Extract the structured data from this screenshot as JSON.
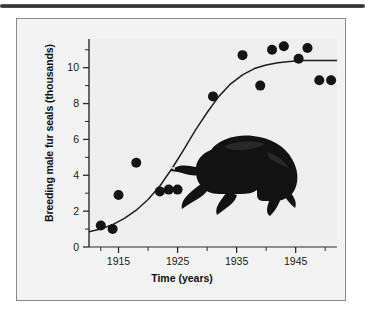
{
  "figure": {
    "background_color": "#f3f3f3",
    "frame_color": "#8a8a8a",
    "top_rule_color": "#2c2c2c"
  },
  "illustration": {
    "name": "fur-seal-silhouette",
    "color": "#111111",
    "description": "Dark silhouette of a male fur seal facing left"
  },
  "chart_data": {
    "type": "scatter",
    "title": "",
    "subtitle": "",
    "xlabel": "Time (years)",
    "ylabel": "Breeding male fur seals (thousands)",
    "xlim": [
      1910,
      1952
    ],
    "ylim": [
      0,
      11.6
    ],
    "grid": false,
    "legend": null,
    "xticks": [
      1915,
      1925,
      1935,
      1945
    ],
    "xtick_labels": [
      "1915",
      "1925",
      "1935",
      "1945"
    ],
    "xminor_ticks": [
      1912,
      1920,
      1930,
      1940,
      1950
    ],
    "yticks": [
      0,
      2,
      4,
      6,
      8,
      10
    ],
    "ytick_labels": [
      "0",
      "2",
      "4",
      "6",
      "8",
      "10"
    ],
    "yminor_ticks": [
      1,
      3,
      5,
      7,
      9,
      11
    ],
    "marker_color": "#141414",
    "marker_size": 5,
    "curve_color": "#1f1f1f",
    "series": [
      {
        "name": "Breeding male fur seals",
        "x": [
          1912,
          1914,
          1915,
          1918,
          1922,
          1923.5,
          1925,
          1931,
          1936,
          1939,
          1941,
          1943,
          1945.5,
          1947,
          1949,
          1951
        ],
        "values": [
          1.2,
          1.0,
          2.9,
          4.7,
          3.1,
          3.2,
          3.2,
          8.4,
          10.7,
          9.0,
          11.0,
          11.2,
          10.5,
          11.1,
          9.3,
          9.3
        ]
      },
      {
        "name": "Fitted logistic curve",
        "type": "line",
        "x": [
          1910,
          1912,
          1914,
          1916,
          1918,
          1920,
          1922,
          1924,
          1926,
          1928,
          1930,
          1932,
          1934,
          1936,
          1938,
          1940,
          1942,
          1944,
          1946,
          1948,
          1950,
          1952
        ],
        "values": [
          0.85,
          1.0,
          1.25,
          1.6,
          2.05,
          2.65,
          3.4,
          4.35,
          5.4,
          6.5,
          7.5,
          8.4,
          9.1,
          9.6,
          9.95,
          10.15,
          10.28,
          10.35,
          10.4,
          10.4,
          10.4,
          10.4
        ]
      }
    ]
  }
}
